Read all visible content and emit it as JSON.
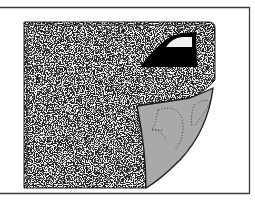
{
  "illustration": {
    "subject": "fabric-sheet-with-iron-peeled-corner",
    "colors": {
      "background": "#ffffff",
      "frame": "#3a3a3a",
      "sheet_fill": "#f2f2f2",
      "speckle": "#2a2a2a",
      "iron": "#000000",
      "peel_fill": "#a9a9a9",
      "peel_outline": "#1a1a1a",
      "dotted_pattern": "#555555"
    },
    "icons": [
      "iron-icon",
      "peeled-corner",
      "dotted-pattern-shapes"
    ]
  }
}
